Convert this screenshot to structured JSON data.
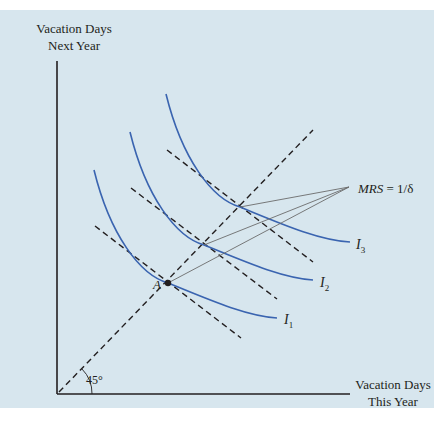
{
  "diagram": {
    "y_axis_label": [
      "Vacation Days",
      "Next Year"
    ],
    "x_axis_label": [
      "Vacation Days",
      "This Year"
    ],
    "angle_label": "45°",
    "point_label": "A",
    "mrs_label_italic": "MRS",
    "mrs_label_rest": " = 1/δ",
    "curves": [
      {
        "name": "I",
        "subscript": "1"
      },
      {
        "name": "I",
        "subscript": "2"
      },
      {
        "name": "I",
        "subscript": "3"
      }
    ],
    "colors": {
      "background": "#d7e6ee",
      "curve": "#3a64b0",
      "axis": "#231f20",
      "dashed": "#231f20",
      "leader": "#6b6b6b"
    }
  }
}
